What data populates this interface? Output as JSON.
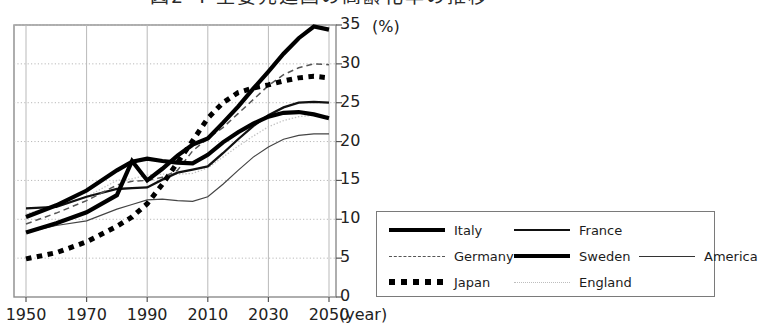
{
  "title": {
    "text": "図2-4 主要先進国の高齢化率の推移",
    "clipped": true
  },
  "axes": {
    "y_unit": "(%)",
    "x_unit": "(year)",
    "y_ticks": [
      "0",
      "5",
      "10",
      "15",
      "20",
      "25",
      "30",
      "35"
    ],
    "x_ticks": [
      "1950",
      "1970",
      "1990",
      "2010",
      "2030",
      "2050"
    ]
  },
  "legend": {
    "rows": [
      [
        {
          "label": "Italy",
          "style": "thick-solid"
        },
        {
          "label": "France",
          "style": "medium-solid"
        }
      ],
      [
        {
          "label": "Germany",
          "style": "dashed"
        },
        {
          "label": "Sweden",
          "style": "thick-solid"
        },
        {
          "label": "America",
          "style": "thin-solid"
        }
      ],
      [
        {
          "label": "Japan",
          "style": "square-dotted"
        },
        {
          "label": "England",
          "style": "fine-dotted"
        }
      ]
    ]
  },
  "chart_data": {
    "type": "line",
    "title": "図2-4 主要先進国の高齢化率の推移",
    "xlabel": "(year)",
    "ylabel": "(%)",
    "xlim": [
      1950,
      2050
    ],
    "ylim": [
      0,
      35
    ],
    "grid": true,
    "legend_position": "bottom-right-outside",
    "x": [
      1950,
      1960,
      1970,
      1980,
      1985,
      1990,
      1995,
      2000,
      2005,
      2010,
      2015,
      2020,
      2025,
      2030,
      2035,
      2040,
      2045,
      2050
    ],
    "series": [
      {
        "name": "Italy",
        "style": "thick-solid",
        "values": [
          8.3,
          9.5,
          10.9,
          13.1,
          17.5,
          15.0,
          16.5,
          18.2,
          19.6,
          20.4,
          22.4,
          24.5,
          26.8,
          29.0,
          31.3,
          33.3,
          34.8,
          34.4
        ]
      },
      {
        "name": "Japan",
        "style": "square-dotted",
        "values": [
          4.9,
          5.7,
          7.1,
          9.1,
          10.3,
          12.0,
          14.5,
          17.3,
          20.1,
          23.0,
          25.0,
          26.3,
          26.9,
          27.3,
          27.8,
          28.2,
          28.4,
          28.2
        ]
      },
      {
        "name": "Germany",
        "style": "dashed",
        "values": [
          9.4,
          10.8,
          12.4,
          14.4,
          14.9,
          15.0,
          15.4,
          16.3,
          18.8,
          20.4,
          21.8,
          23.6,
          25.4,
          27.2,
          28.6,
          29.5,
          30.0,
          29.9
        ]
      },
      {
        "name": "Sweden",
        "style": "thick-solid",
        "values": [
          10.3,
          11.8,
          13.7,
          16.3,
          17.4,
          17.8,
          17.5,
          17.3,
          17.2,
          18.3,
          19.9,
          21.2,
          22.3,
          23.2,
          23.7,
          23.8,
          23.5,
          23.0
        ]
      },
      {
        "name": "France",
        "style": "medium-solid",
        "values": [
          11.4,
          11.6,
          12.9,
          13.9,
          14.0,
          14.1,
          15.1,
          16.0,
          16.4,
          16.8,
          18.5,
          20.3,
          22.0,
          23.4,
          24.4,
          25.0,
          25.1,
          25.0
        ]
      },
      {
        "name": "America",
        "style": "thin-solid",
        "values": [
          8.3,
          9.2,
          9.8,
          11.3,
          11.9,
          12.5,
          12.6,
          12.4,
          12.3,
          12.9,
          14.5,
          16.3,
          18.0,
          19.3,
          20.3,
          20.8,
          21.0,
          21.0
        ]
      },
      {
        "name": "England",
        "style": "fine-dotted",
        "values": [
          10.7,
          11.7,
          12.9,
          15.0,
          15.2,
          15.7,
          15.8,
          15.8,
          15.9,
          16.6,
          18.0,
          19.4,
          20.7,
          21.9,
          22.7,
          23.2,
          23.4,
          23.3
        ]
      }
    ]
  }
}
